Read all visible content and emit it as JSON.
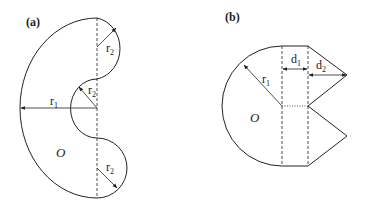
{
  "figure": {
    "panels": [
      {
        "id": "a",
        "label": "(a)",
        "origin_label": "O",
        "dimensions": [
          {
            "name": "r",
            "sub": "1"
          },
          {
            "name": "r",
            "sub": "2",
            "position": "top"
          },
          {
            "name": "r",
            "sub": "2",
            "position": "middle"
          },
          {
            "name": "r",
            "sub": "2",
            "position": "bottom"
          }
        ]
      },
      {
        "id": "b",
        "label": "(b)",
        "origin_label": "O",
        "dimensions": [
          {
            "name": "r",
            "sub": "1"
          },
          {
            "name": "d",
            "sub": "1"
          },
          {
            "name": "d",
            "sub": "2"
          }
        ]
      }
    ],
    "colors": {
      "stroke": "#222222",
      "background": "#ffffff"
    }
  }
}
